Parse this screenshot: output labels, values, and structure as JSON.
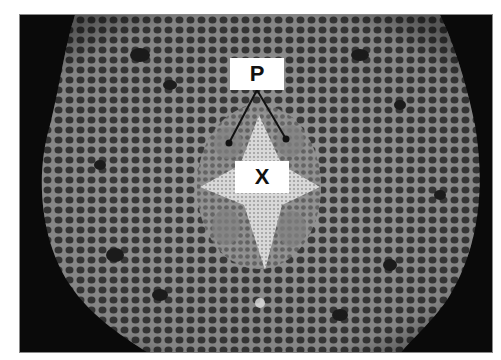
{
  "figure": {
    "labels": [
      {
        "id": "P",
        "text": "P",
        "meaning": "phloem (two pointer lines)"
      },
      {
        "id": "X",
        "text": "X",
        "meaning": "xylem"
      }
    ],
    "colors": {
      "background": "#0a0a0a",
      "tissue": "#6e6e6e",
      "label_box": "#ffffff",
      "label_text": "#111111"
    }
  }
}
